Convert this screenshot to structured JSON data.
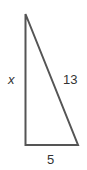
{
  "diagram": {
    "type": "right-triangle",
    "stroke_color": "#555555",
    "vertices": {
      "top": [
        25.5,
        14
      ],
      "bottom_left": [
        25.5,
        145
      ],
      "bottom_right": [
        78,
        145
      ]
    },
    "labels": {
      "vertical_side": "x",
      "hypotenuse": "13",
      "base": "5"
    }
  }
}
